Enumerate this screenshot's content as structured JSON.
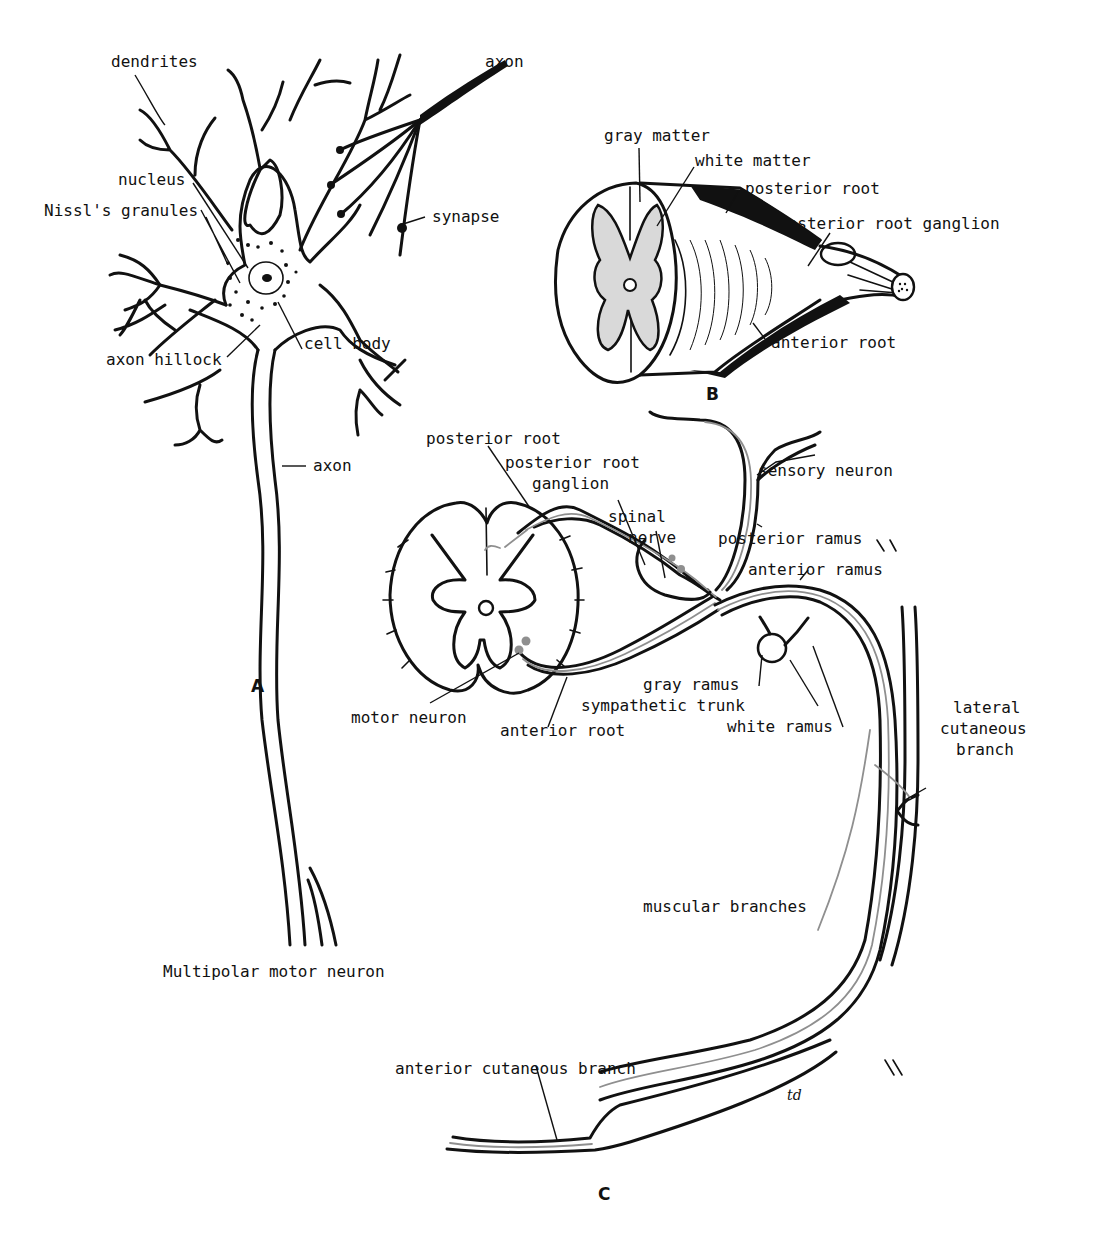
{
  "figure": {
    "colors": {
      "ink": "#111111",
      "nerve_fiber_gray": "#8f8f8f",
      "background": "#ffffff"
    },
    "signature": "td",
    "panel_a": {
      "letter": "A",
      "caption": "Multipolar motor neuron",
      "labels": {
        "dendrites": "dendrites",
        "axon_top": "axon",
        "nucleus": "nucleus",
        "nissl": "Nissl's granules",
        "synapse": "synapse",
        "axon_hillock": "axon hillock",
        "cell_body": "cell body",
        "axon": "axon"
      }
    },
    "panel_b": {
      "letter": "B",
      "labels": {
        "gray_matter": "gray matter",
        "white_matter": "white matter",
        "posterior_root": "posterior root",
        "posterior_root_ganglion": "posterior root ganglion",
        "anterior_root": "anterior root"
      }
    },
    "panel_c": {
      "letter": "C",
      "labels": {
        "posterior_root": "posterior root",
        "posterior_root_ganglion_1": "posterior root",
        "posterior_root_ganglion_2": "ganglion",
        "spinal_nerve_1": "spinal",
        "spinal_nerve_2": "nerve",
        "sensory_neuron": "sensory neuron",
        "posterior_ramus": "posterior ramus",
        "anterior_ramus": "anterior ramus",
        "motor_neuron": "motor neuron",
        "anterior_root": "anterior root",
        "gray_ramus": "gray ramus",
        "sympathetic_trunk": "sympathetic trunk",
        "white_ramus": "white ramus",
        "lateral_cutaneous_1": "lateral",
        "lateral_cutaneous_2": "cutaneous",
        "lateral_cutaneous_3": "branch",
        "muscular_branches": "muscular branches",
        "anterior_cutaneous_branch": "anterior cutaneous branch"
      }
    }
  }
}
